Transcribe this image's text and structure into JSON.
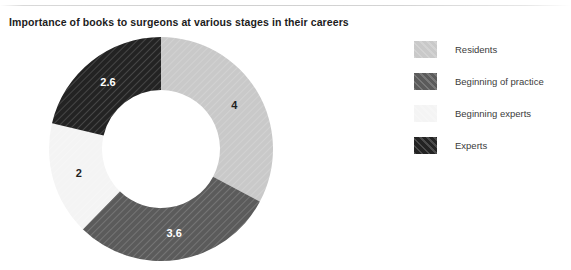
{
  "chart_data": {
    "type": "pie",
    "variant": "donut",
    "title": "Importance of books to surgeons at various stages in their careers",
    "xlabel": "",
    "ylabel": "",
    "categories": [
      "Residents",
      "Beginning of practice",
      "Beginning experts",
      "Experts"
    ],
    "values": [
      4,
      3.6,
      2,
      2.6
    ],
    "value_labels": [
      "4",
      "3.6",
      "2",
      "2.6"
    ],
    "total": 12.2,
    "start_angle_deg": 0,
    "direction": "clockwise",
    "inner_radius_ratio": 0.53,
    "legend_position": "right",
    "grid": false,
    "slices": [
      {
        "label": "Residents",
        "value": 4,
        "value_label": "4",
        "color": "#c9c9c9",
        "label_color": "#1f1f1f",
        "hatch": "diagonal",
        "percent": 32.8,
        "start_deg": 0,
        "end_deg": 118.0
      },
      {
        "label": "Beginning of practice",
        "value": 3.6,
        "value_label": "3.6",
        "color": "#5b5b5b",
        "label_color": "#ffffff",
        "hatch": "diagonal",
        "percent": 29.5,
        "start_deg": 118.0,
        "end_deg": 224.3
      },
      {
        "label": "Beginning experts",
        "value": 2,
        "value_label": "2",
        "color": "#f4f4f4",
        "label_color": "#1f1f1f",
        "hatch": "diagonal",
        "percent": 16.4,
        "start_deg": 224.3,
        "end_deg": 283.3
      },
      {
        "label": "Experts",
        "value": 2.6,
        "value_label": "2.6",
        "color": "#232323",
        "label_color": "#ffffff",
        "hatch": "diagonal",
        "percent": 21.3,
        "start_deg": 283.3,
        "end_deg": 360.0
      }
    ]
  },
  "legend": {
    "items": [
      {
        "label": "Residents",
        "color": "#c9c9c9"
      },
      {
        "label": "Beginning of practice",
        "color": "#5b5b5b"
      },
      {
        "label": "Beginning experts",
        "color": "#f4f4f4"
      },
      {
        "label": "Experts",
        "color": "#232323"
      }
    ]
  }
}
